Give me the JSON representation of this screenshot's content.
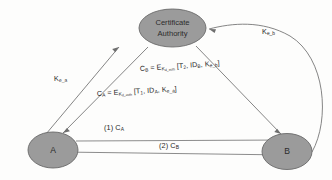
{
  "diagram": {
    "colors": {
      "node_fill": "#9b9b9b",
      "node_stroke": "#6a6a6a",
      "edge_stroke": "#6f6f6f",
      "text": "#262626",
      "background": "#fdfdfc"
    },
    "nodes": [
      {
        "id": "ca",
        "label_line1": "Certificate",
        "label_line2": "Authority"
      },
      {
        "id": "a",
        "label": "A"
      },
      {
        "id": "b",
        "label": "B"
      }
    ],
    "edge_labels": {
      "key_a": {
        "base": "K",
        "sub": "e_a"
      },
      "key_b": {
        "base": "K",
        "sub": "e_b"
      }
    },
    "formulas": {
      "c_b": {
        "lhs_base": "C",
        "lhs_sub": "B",
        "eq": " = ",
        "e_base": "E",
        "e_sub": "K",
        "e_sub_sub": "d_auth",
        "bracket": " [T",
        "t_sub": "2",
        "mid": ", ID",
        "id_sub": "B",
        "tail": ", K",
        "k_sub": "e_b",
        "close": "]"
      },
      "c_a": {
        "lhs_base": "C",
        "lhs_sub": "A",
        "eq": " = ",
        "e_base": "E",
        "e_sub": "K",
        "e_sub_sub": "d_auth",
        "bracket": " [T",
        "t_sub": "1",
        "mid": ", ID",
        "id_sub": "A",
        "tail": ", K",
        "k_sub": "e_a",
        "close": "]"
      }
    },
    "messages": [
      {
        "id": "msg1",
        "number": "(1) ",
        "base": "C",
        "sub": "A"
      },
      {
        "id": "msg2",
        "number": "(2) ",
        "base": "C",
        "sub": "B"
      }
    ]
  }
}
